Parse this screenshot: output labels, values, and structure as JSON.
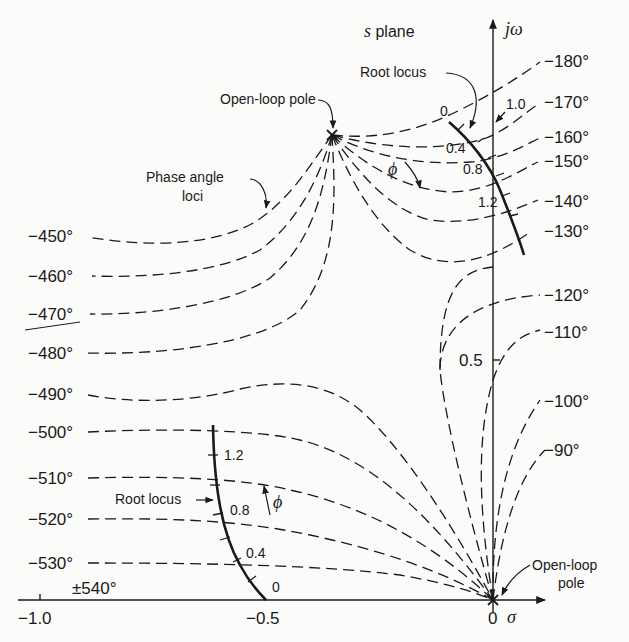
{
  "title": "s plane",
  "axes": {
    "x_label": "σ",
    "y_label": "jω",
    "x_ticks": [
      {
        "value": -1.0,
        "label": "−1.0"
      },
      {
        "value": -0.5,
        "label": "−0.5"
      },
      {
        "value": 0,
        "label": "0"
      }
    ],
    "y_ticks": [
      {
        "value": 0.5,
        "label": "0.5"
      }
    ]
  },
  "annotations": {
    "open_loop_pole_top": "Open-loop pole",
    "open_loop_pole_origin_line1": "Open-loop",
    "open_loop_pole_origin_line2": "pole",
    "phase_angle_loci_line1": "Phase angle",
    "phase_angle_loci_line2": "loci",
    "root_locus_top": "Root locus",
    "root_locus_bottom": "Root locus",
    "phi_symbol": "ϕ"
  },
  "root_locus_upper_gains": [
    "0",
    "0.4",
    "0.8",
    "1.2",
    "1.0"
  ],
  "root_locus_lower_gains": [
    "0",
    "0.4",
    "0.8",
    "1.2"
  ],
  "phase_labels_right": [
    "−180°",
    "−170°",
    "−160°",
    "−150°",
    "−140°",
    "−130°",
    "−120°",
    "−110°",
    "−100°",
    "−90°"
  ],
  "phase_labels_left": [
    "−450°",
    "−460°",
    "−470°",
    "−480°",
    "−490°",
    "−500°",
    "−510°",
    "−520°",
    "−530°",
    "±540°"
  ],
  "colors": {
    "ink": "#1a1a1a",
    "paper": "#fbfbfa"
  }
}
